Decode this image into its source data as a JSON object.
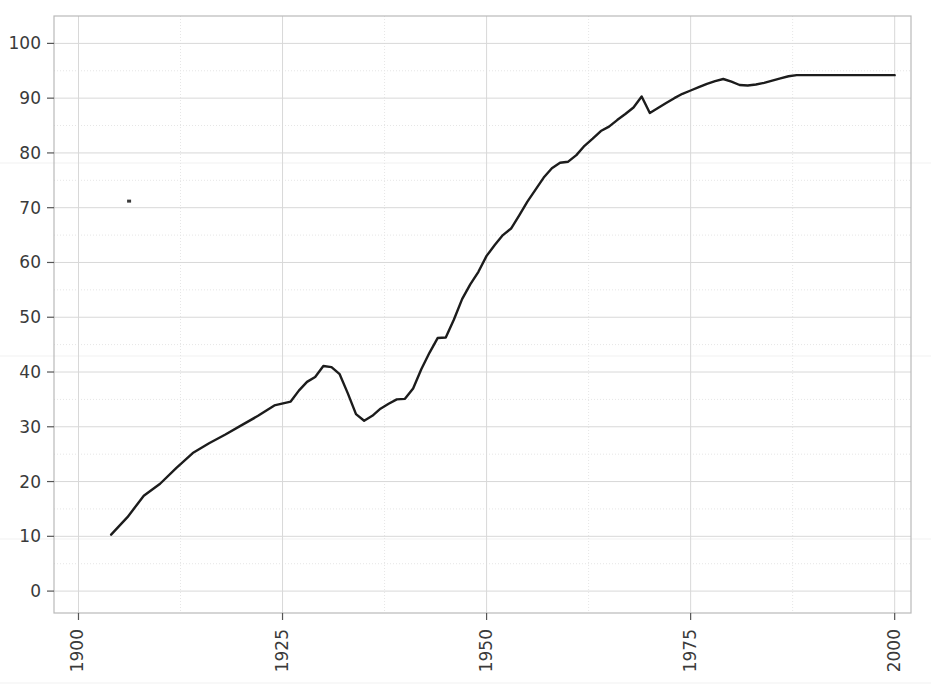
{
  "chart_data": {
    "type": "line",
    "title": "",
    "subtitle": "",
    "xlabel": "",
    "ylabel": "",
    "xlim": [
      1897,
      2002
    ],
    "ylim": [
      -4,
      105
    ],
    "xticks": [
      1900,
      1925,
      1950,
      1975,
      2000
    ],
    "xtick_labels": [
      "1900",
      "1925",
      "1950",
      "1975",
      "2000"
    ],
    "yticks": [
      0,
      10,
      20,
      30,
      40,
      50,
      60,
      70,
      80,
      90,
      100
    ],
    "ytick_labels": [
      "0",
      "10",
      "20",
      "30",
      "40",
      "50",
      "60",
      "70",
      "80",
      "90",
      "100"
    ],
    "xtick_rotation": 90,
    "grid": true,
    "grid_major_step_y": 10,
    "grid_minor_step_y": 5,
    "grid_major_step_x": 25,
    "legend": "none",
    "series": [
      {
        "name": "series-1",
        "color": "#1c1c1c",
        "x": [
          1904,
          1906,
          1908,
          1910,
          1912,
          1914,
          1916,
          1918,
          1920,
          1922,
          1924,
          1926,
          1927,
          1928,
          1929,
          1930,
          1931,
          1932,
          1933,
          1934,
          1935,
          1936,
          1937,
          1938,
          1939,
          1940,
          1941,
          1942,
          1943,
          1944,
          1945,
          1946,
          1947,
          1948,
          1949,
          1950,
          1951,
          1952,
          1953,
          1954,
          1955,
          1956,
          1957,
          1958,
          1959,
          1960,
          1961,
          1962,
          1963,
          1964,
          1965,
          1966,
          1967,
          1968,
          1969,
          1970,
          1971,
          1972,
          1973,
          1974,
          1975,
          1976,
          1977,
          1978,
          1979,
          1980,
          1981,
          1982,
          1983,
          1984,
          1985,
          1986,
          1987,
          1988,
          1990,
          1992,
          1994,
          1996,
          1998,
          2000
        ],
        "y": [
          10.3,
          13.5,
          17.4,
          19.6,
          22.5,
          25.2,
          27.0,
          28.6,
          30.3,
          32.0,
          33.9,
          34.6,
          36.6,
          38.2,
          39.1,
          41.1,
          40.9,
          39.6,
          36.1,
          32.3,
          31.1,
          32.0,
          33.3,
          34.2,
          35.0,
          35.1,
          37.0,
          40.5,
          43.5,
          46.2,
          46.3,
          49.6,
          53.3,
          56.0,
          58.3,
          61.2,
          63.2,
          65.0,
          66.2,
          68.6,
          71.1,
          73.3,
          75.5,
          77.2,
          78.2,
          78.4,
          79.6,
          81.3,
          82.6,
          84.0,
          84.8,
          86.0,
          87.1,
          88.3,
          90.3,
          87.3,
          88.2,
          89.1,
          90.0,
          90.8,
          91.4,
          92.0,
          92.6,
          93.1,
          93.5,
          93.0,
          92.4,
          92.3,
          92.5,
          92.8,
          93.2,
          93.6,
          94.0,
          94.2,
          94.2,
          94.2,
          94.2,
          94.2,
          94.2,
          94.2
        ]
      }
    ],
    "annotations": [
      {
        "name": "scan-speck",
        "x": 1906.2,
        "y": 71.2
      }
    ],
    "colors": {
      "line": "#1c1c1c",
      "grid_major": "#d8d8d8",
      "grid_minor": "#e6e6e6",
      "frame": "#b9b9b9",
      "tick_text": "#3a3a3a",
      "background": "#ffffff"
    },
    "plot_area_px": {
      "left": 54,
      "top": 16,
      "right": 911,
      "bottom": 613
    }
  }
}
